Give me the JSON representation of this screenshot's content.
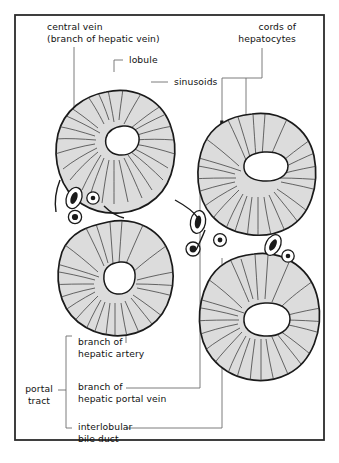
{
  "figure": {
    "type": "anatomical-diagram",
    "frame": {
      "stroke": "#2b2b2b",
      "fill": "#ffffff"
    },
    "palette": {
      "lobule_fill": "#dcdcdc",
      "lobule_stroke": "#1a1a1a",
      "sinusoid_stroke": "#3a3a3a",
      "central_vein_fill": "#ffffff",
      "leader_stroke": "#6e6e6e",
      "text": "#111111"
    },
    "labels": {
      "central_vein": "central vein\n(branch of hepatic vein)",
      "lobule": "lobule",
      "sinusoids": "sinusoids",
      "cords_of_hepatocytes": "cords of\nhepatocytes",
      "portal_tract": "portal\ntract",
      "branch_hepatic_artery": "branch of\nhepatic artery",
      "branch_hepatic_portal_vein": "branch of\nhepatic portal vein",
      "interlobular_bile_duct": "interlobular\nbile duct"
    },
    "structures": {
      "lobules": 4,
      "portal_triads": 3,
      "triad_components": [
        "hepatic artery branch",
        "hepatic portal vein branch",
        "interlobular bile duct"
      ]
    }
  }
}
